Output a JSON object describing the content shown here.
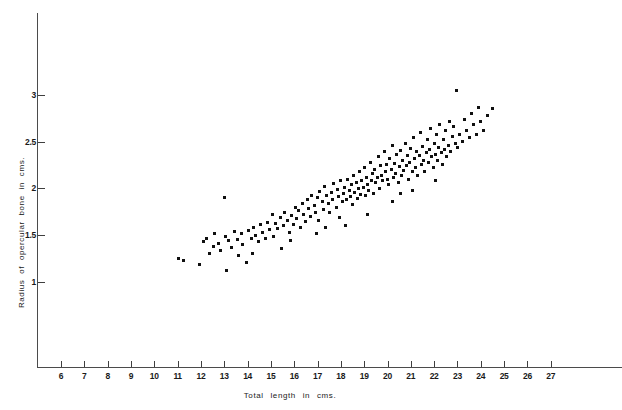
{
  "chart_data": {
    "type": "scatter",
    "title": "",
    "xlabel": "Total    length   in   cms.",
    "ylabel": "Radius   of   opercular   bone   in   cms.",
    "xlim": [
      5.1,
      30.2
    ],
    "ylim": [
      0,
      3.75
    ],
    "grid": false,
    "legend": null,
    "marker": "filled-square",
    "marker_color": "#101010",
    "xticks": [
      6,
      7,
      8,
      9,
      10,
      11,
      12,
      13,
      14,
      15,
      16,
      17,
      18,
      19,
      20,
      21,
      22,
      23,
      24,
      25,
      26,
      27
    ],
    "yticks": [
      1,
      1.5,
      2,
      2.5,
      3
    ],
    "xtick_labels": [
      "6",
      "7",
      "8",
      "9",
      "10",
      "11",
      "12",
      "13",
      "14",
      "15",
      "16",
      "17",
      "18",
      "19",
      "20",
      "21",
      "22",
      "23",
      "24",
      "25",
      "26",
      "27"
    ],
    "ytick_labels": [
      "1",
      "1.5",
      "2",
      "2.5",
      "3"
    ],
    "n_points": 191,
    "points": [
      [
        11.05,
        1.25
      ],
      [
        11.25,
        1.23
      ],
      [
        11.95,
        1.19
      ],
      [
        12.1,
        1.43
      ],
      [
        12.25,
        1.46
      ],
      [
        12.35,
        1.31
      ],
      [
        12.55,
        1.38
      ],
      [
        12.6,
        1.52
      ],
      [
        12.75,
        1.41
      ],
      [
        12.85,
        1.34
      ],
      [
        13.0,
        1.9
      ],
      [
        13.05,
        1.49
      ],
      [
        13.2,
        1.44
      ],
      [
        13.3,
        1.37
      ],
      [
        13.45,
        1.54
      ],
      [
        13.55,
        1.45
      ],
      [
        13.6,
        1.28
      ],
      [
        13.75,
        1.52
      ],
      [
        13.8,
        1.4
      ],
      [
        13.95,
        1.21
      ],
      [
        14.05,
        1.55
      ],
      [
        14.15,
        1.47
      ],
      [
        14.25,
        1.58
      ],
      [
        14.35,
        1.5
      ],
      [
        14.45,
        1.43
      ],
      [
        14.55,
        1.61
      ],
      [
        14.65,
        1.53
      ],
      [
        14.75,
        1.46
      ],
      [
        14.85,
        1.64
      ],
      [
        14.95,
        1.56
      ],
      [
        15.05,
        1.72
      ],
      [
        15.1,
        1.49
      ],
      [
        15.2,
        1.63
      ],
      [
        15.3,
        1.57
      ],
      [
        15.4,
        1.69
      ],
      [
        15.45,
        1.36
      ],
      [
        15.55,
        1.6
      ],
      [
        15.6,
        1.74
      ],
      [
        15.7,
        1.66
      ],
      [
        15.8,
        1.53
      ],
      [
        15.9,
        1.71
      ],
      [
        15.95,
        1.62
      ],
      [
        16.05,
        1.8
      ],
      [
        16.1,
        1.68
      ],
      [
        16.2,
        1.76
      ],
      [
        16.25,
        1.58
      ],
      [
        16.35,
        1.84
      ],
      [
        16.4,
        1.72
      ],
      [
        16.5,
        1.65
      ],
      [
        16.55,
        1.88
      ],
      [
        16.6,
        1.79
      ],
      [
        16.7,
        1.7
      ],
      [
        16.75,
        1.93
      ],
      [
        16.85,
        1.82
      ],
      [
        16.9,
        1.74
      ],
      [
        17.0,
        1.9
      ],
      [
        17.05,
        1.66
      ],
      [
        17.1,
        1.97
      ],
      [
        17.2,
        1.86
      ],
      [
        17.25,
        1.78
      ],
      [
        17.3,
        2.02
      ],
      [
        17.4,
        1.92
      ],
      [
        17.45,
        1.84
      ],
      [
        17.5,
        1.74
      ],
      [
        17.6,
        1.96
      ],
      [
        17.65,
        1.88
      ],
      [
        17.7,
        2.05
      ],
      [
        17.8,
        1.8
      ],
      [
        17.85,
        1.99
      ],
      [
        17.9,
        1.91
      ],
      [
        17.95,
        1.69
      ],
      [
        18.0,
        2.08
      ],
      [
        18.05,
        1.86
      ],
      [
        18.1,
        1.95
      ],
      [
        18.15,
        2.01
      ],
      [
        18.25,
        1.88
      ],
      [
        18.3,
        2.1
      ],
      [
        18.35,
        1.98
      ],
      [
        18.4,
        1.91
      ],
      [
        18.45,
        2.04
      ],
      [
        18.5,
        1.83
      ],
      [
        18.55,
        2.14
      ],
      [
        18.6,
        1.96
      ],
      [
        18.65,
        2.06
      ],
      [
        18.7,
        1.89
      ],
      [
        18.75,
        2.0
      ],
      [
        18.8,
        2.18
      ],
      [
        18.85,
        1.94
      ],
      [
        18.9,
        2.08
      ],
      [
        18.95,
        2.01
      ],
      [
        19.0,
        2.22
      ],
      [
        19.05,
        1.92
      ],
      [
        19.1,
        2.12
      ],
      [
        19.15,
        2.04
      ],
      [
        19.2,
        1.98
      ],
      [
        19.25,
        2.28
      ],
      [
        19.3,
        2.08
      ],
      [
        19.35,
        2.16
      ],
      [
        19.4,
        1.95
      ],
      [
        19.45,
        2.2
      ],
      [
        19.5,
        2.06
      ],
      [
        19.55,
        2.12
      ],
      [
        19.6,
        2.34
      ],
      [
        19.65,
        2.0
      ],
      [
        19.7,
        2.24
      ],
      [
        19.75,
        2.14
      ],
      [
        19.8,
        2.08
      ],
      [
        19.85,
        2.4
      ],
      [
        19.9,
        2.18
      ],
      [
        19.95,
        2.26
      ],
      [
        20.0,
        2.1
      ],
      [
        20.05,
        2.04
      ],
      [
        20.1,
        2.32
      ],
      [
        20.15,
        2.2
      ],
      [
        20.2,
        2.46
      ],
      [
        20.25,
        2.12
      ],
      [
        20.3,
        2.27
      ],
      [
        20.35,
        2.16
      ],
      [
        20.4,
        2.36
      ],
      [
        20.45,
        2.06
      ],
      [
        20.5,
        2.23
      ],
      [
        20.55,
        2.41
      ],
      [
        20.6,
        2.14
      ],
      [
        20.65,
        2.3
      ],
      [
        20.7,
        2.19
      ],
      [
        20.75,
        2.48
      ],
      [
        20.8,
        2.24
      ],
      [
        20.85,
        2.35
      ],
      [
        20.9,
        2.1
      ],
      [
        20.95,
        2.28
      ],
      [
        21.0,
        2.43
      ],
      [
        21.05,
        2.18
      ],
      [
        21.1,
        2.54
      ],
      [
        21.15,
        2.32
      ],
      [
        21.2,
        2.22
      ],
      [
        21.25,
        2.4
      ],
      [
        21.3,
        2.14
      ],
      [
        21.35,
        2.35
      ],
      [
        21.4,
        2.6
      ],
      [
        21.45,
        2.26
      ],
      [
        21.5,
        2.45
      ],
      [
        21.55,
        2.3
      ],
      [
        21.6,
        2.18
      ],
      [
        21.65,
        2.38
      ],
      [
        21.7,
        2.52
      ],
      [
        21.75,
        2.28
      ],
      [
        21.8,
        2.42
      ],
      [
        21.85,
        2.64
      ],
      [
        21.9,
        2.34
      ],
      [
        21.95,
        2.22
      ],
      [
        22.0,
        2.48
      ],
      [
        22.05,
        2.36
      ],
      [
        22.1,
        2.58
      ],
      [
        22.15,
        2.3
      ],
      [
        22.2,
        2.44
      ],
      [
        22.25,
        2.68
      ],
      [
        22.3,
        2.38
      ],
      [
        22.35,
        2.26
      ],
      [
        22.4,
        2.52
      ],
      [
        22.45,
        2.42
      ],
      [
        22.5,
        2.62
      ],
      [
        22.55,
        2.34
      ],
      [
        22.6,
        2.46
      ],
      [
        22.65,
        2.72
      ],
      [
        22.7,
        2.4
      ],
      [
        22.8,
        2.56
      ],
      [
        22.85,
        2.66
      ],
      [
        22.9,
        2.48
      ],
      [
        22.95,
        3.05
      ],
      [
        23.0,
        2.44
      ],
      [
        23.1,
        2.58
      ],
      [
        23.2,
        2.5
      ],
      [
        23.3,
        2.74
      ],
      [
        23.4,
        2.62
      ],
      [
        23.5,
        2.54
      ],
      [
        23.6,
        2.8
      ],
      [
        23.7,
        2.68
      ],
      [
        23.8,
        2.58
      ],
      [
        23.9,
        2.86
      ],
      [
        24.0,
        2.72
      ],
      [
        24.1,
        2.62
      ],
      [
        24.3,
        2.78
      ],
      [
        24.5,
        2.85
      ],
      [
        13.1,
        1.12
      ],
      [
        14.2,
        1.31
      ],
      [
        16.95,
        1.52
      ],
      [
        18.2,
        1.6
      ],
      [
        19.15,
        1.72
      ],
      [
        20.2,
        1.86
      ],
      [
        21.05,
        1.98
      ],
      [
        22.05,
        2.08
      ],
      [
        20.55,
        1.95
      ],
      [
        17.35,
        1.58
      ],
      [
        15.85,
        1.44
      ]
    ]
  },
  "axis": {
    "x_origin_px": 37,
    "y_origin_px": 367
  }
}
